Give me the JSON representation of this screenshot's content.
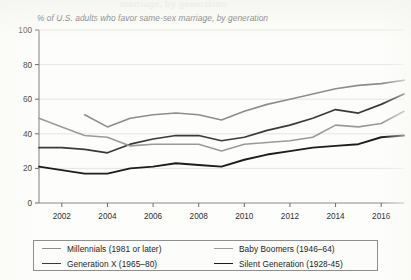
{
  "cropped_title_fragment": "marriage, by generation",
  "subtitle": "% of U.S. adults who favor same-sex marriage, by generation",
  "legend": {
    "entries": [
      {
        "label": "Millennials (1981 or later)",
        "color": "#8d8d8d",
        "width": 1.6
      },
      {
        "label": "Baby Boomers (1946–64)",
        "color": "#9a9a9a",
        "width": 1.5
      },
      {
        "label": "Generation X (1965–80)",
        "color": "#3a3a3a",
        "width": 1.7
      },
      {
        "label": "Silent Generation (1928-45)",
        "color": "#1d1d1d",
        "width": 1.9
      }
    ]
  },
  "chart_data": {
    "type": "line",
    "title": "% of U.S. adults who favor same-sex marriage, by generation",
    "xlabel": "",
    "ylabel": "",
    "ylim": [
      0,
      100
    ],
    "xlim": [
      2001,
      2017
    ],
    "yticks": [
      0,
      20,
      40,
      60,
      80,
      100
    ],
    "xticks": [
      2002,
      2004,
      2006,
      2008,
      2010,
      2012,
      2014,
      2016
    ],
    "grid": true,
    "legend_position": "bottom",
    "series": [
      {
        "name": "Millennials (1981 or later)",
        "color": "#8d8d8d",
        "x": [
          2003,
          2004,
          2005,
          2006,
          2007,
          2008,
          2009,
          2010,
          2011,
          2012,
          2013,
          2014,
          2015,
          2016,
          2017
        ],
        "values": [
          51,
          44,
          49,
          51,
          52,
          51,
          48,
          53,
          57,
          60,
          63,
          66,
          68,
          69,
          71
        ]
      },
      {
        "name": "Generation X (1965–80)",
        "color": "#3a3a3a",
        "x": [
          2001,
          2002,
          2003,
          2004,
          2005,
          2006,
          2007,
          2008,
          2009,
          2010,
          2011,
          2012,
          2013,
          2014,
          2015,
          2016,
          2017
        ],
        "values": [
          32,
          32,
          31,
          29,
          34,
          37,
          39,
          39,
          36,
          38,
          42,
          45,
          49,
          54,
          52,
          57,
          63
        ]
      },
      {
        "name": "Baby Boomers (1946–64)",
        "color": "#9a9a9a",
        "x": [
          2001,
          2002,
          2003,
          2004,
          2005,
          2006,
          2007,
          2008,
          2009,
          2010,
          2011,
          2012,
          2013,
          2014,
          2015,
          2016,
          2017
        ],
        "values": [
          49,
          44,
          39,
          38,
          33,
          34,
          34,
          34,
          30,
          34,
          35,
          36,
          38,
          45,
          44,
          46,
          53
        ]
      },
      {
        "name": "Silent Generation (1928-45)",
        "color": "#1d1d1d",
        "x": [
          2001,
          2002,
          2003,
          2004,
          2005,
          2006,
          2007,
          2008,
          2009,
          2010,
          2011,
          2012,
          2013,
          2014,
          2015,
          2016,
          2017
        ],
        "values": [
          21,
          19,
          17,
          17,
          20,
          21,
          23,
          22,
          21,
          25,
          28,
          30,
          32,
          33,
          34,
          38,
          39
        ]
      }
    ]
  }
}
